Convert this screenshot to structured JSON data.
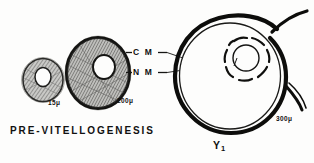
{
  "figure": {
    "background_color": "#fdfdfc",
    "ink_color": "#111111",
    "width": 314,
    "height": 163
  },
  "labels": {
    "cell_membrane": "C M",
    "nuclear_membrane": "N M",
    "caption_left": "PRE-VITELLOGENESIS",
    "stage_right": "Y",
    "stage_right_subscript": "1"
  },
  "scale_labels": {
    "small_oocyte": "15μ",
    "medium_oocyte": "200μ",
    "large_oocyte": "300μ"
  },
  "cells": [
    {
      "name": "small-oocyte",
      "diameter_label": "15μ",
      "cx": 43,
      "cy": 80,
      "rx": 21,
      "ry": 22,
      "nucleus_cx": 43,
      "nucleus_cy": 77,
      "nucleus_rx": 8,
      "nucleus_ry": 9.5,
      "cytoplasm": "hatched",
      "outer_ring": "thin"
    },
    {
      "name": "medium-oocyte",
      "diameter_label": "200μ",
      "cx": 98,
      "cy": 73,
      "rx": 32,
      "ry": 36,
      "nucleus_cx": 104,
      "nucleus_cy": 67,
      "nucleus_rx": 11,
      "nucleus_ry": 12,
      "cytoplasm": "hatched",
      "outer_ring": "thick-dark"
    },
    {
      "name": "large-oocyte",
      "diameter_label": "300μ",
      "cx": 230,
      "cy": 76,
      "rx": 55,
      "ry": 58,
      "nucleus_cx": 246,
      "nucleus_cy": 58,
      "nucleus_rx": 14,
      "nucleus_ry": 14,
      "cytoplasm": "clear",
      "outer_ring": "thick-spiral"
    }
  ],
  "leader_lines": [
    {
      "name": "cm-leader",
      "from_label": "C M",
      "points_to": "large-oocyte-outer-membrane"
    },
    {
      "name": "nm-leader",
      "from_label": "N M",
      "points_to": "large-oocyte-nuclear-membrane"
    }
  ]
}
